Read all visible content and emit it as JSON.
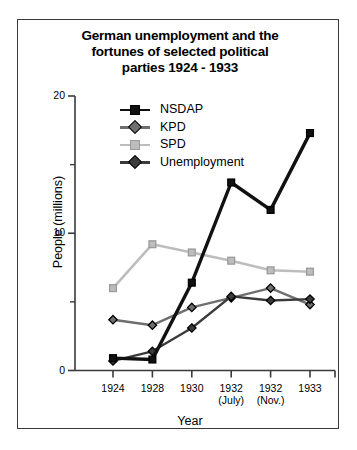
{
  "chart_data": {
    "type": "line",
    "title": "German unemployment and the fortunes of selected political parties 1924 - 1933",
    "title_lines": [
      "German unemployment and the",
      "fortunes of selected political",
      "parties 1924 - 1933"
    ],
    "xlabel": "Year",
    "ylabel": "People (millions)",
    "categories": [
      "1924",
      "1928",
      "1930",
      "1932",
      "1932",
      "1933"
    ],
    "category_sublabels": [
      "",
      "",
      "",
      "(July)",
      "(Nov.)",
      ""
    ],
    "ylim": [
      0,
      20
    ],
    "ytick_labels": [
      "0",
      "10",
      "20"
    ],
    "ytick_values": [
      0,
      10,
      20
    ],
    "yminor_values": [
      5,
      15
    ],
    "grid": false,
    "legend_position": "top-center-inside",
    "series": [
      {
        "name": "NSDAP",
        "color": "#111111",
        "marker": "square",
        "values": [
          0.9,
          0.8,
          6.4,
          13.7,
          11.7,
          17.3
        ]
      },
      {
        "name": "KPD",
        "color": "#6f6f6f",
        "marker": "diamond",
        "values": [
          3.7,
          3.3,
          4.6,
          5.3,
          6.0,
          4.8
        ]
      },
      {
        "name": "SPD",
        "color": "#bdbdbd",
        "marker": "square",
        "values": [
          6.0,
          9.2,
          8.6,
          8.0,
          7.3,
          7.2
        ]
      },
      {
        "name": "Unemployment",
        "color": "#3b3b3b",
        "marker": "diamond",
        "values": [
          0.7,
          1.4,
          3.1,
          5.4,
          5.1,
          5.2
        ]
      }
    ]
  }
}
